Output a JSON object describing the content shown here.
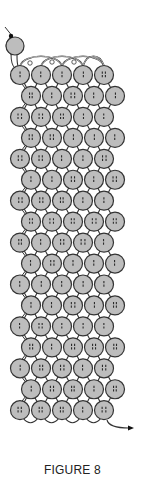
{
  "figure": {
    "caption": "FIGURE 8"
  },
  "colors": {
    "background": "#ffffff",
    "bead_fill": "#bdbdbd",
    "bead_outline": "#333333",
    "thread": "#333333",
    "hole_mark": "#2a2a2a",
    "caption_text": "#222222"
  },
  "grid": {
    "rows": 17,
    "beads_per_row": 5,
    "bead_radius": 9.5,
    "row_spacing": 20.95,
    "first_row_y": 75,
    "even_row_x": [
      20,
      41,
      62,
      83,
      104
    ],
    "odd_row_x": [
      31,
      52,
      73,
      94,
      115
    ]
  },
  "start_bead": {
    "cx": 15,
    "cy": 46,
    "r": 9
  },
  "needle": {
    "x1": 5,
    "y1": 27,
    "x2": 11,
    "y2": 36
  },
  "exit_arrow": {
    "from": [
      107,
      420
    ],
    "to": [
      134,
      428
    ]
  },
  "icons": {
    "start": "needle-start-icon",
    "end": "arrow-exit-icon"
  }
}
